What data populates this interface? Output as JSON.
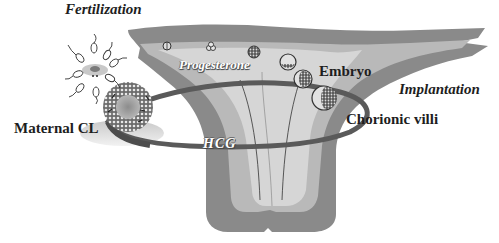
{
  "diagram": {
    "labels": {
      "fertilization": "Fertilization",
      "progesterone": "Progesterone",
      "embryo": "Embryo",
      "implantation": "Implantation",
      "chorionic_villi": "Chorionic villi",
      "maternal_cl": "Maternal CL",
      "hcg": "HCG"
    },
    "elements": [
      {
        "id": "oocyte-with-sperm",
        "description": "Oocyte surrounded by sperm at fertilization site"
      },
      {
        "id": "corpus-luteum",
        "description": "Maternal corpus luteum (follicle-like textured sphere)"
      },
      {
        "id": "uterine-tube",
        "description": "Fallopian tube with developing embryos"
      },
      {
        "id": "uterus",
        "description": "Uterine body with endometrium layers"
      },
      {
        "id": "embryo-stages",
        "count": 6,
        "description": "Zygote to blastocyst stages moving through the tube"
      },
      {
        "id": "hormone-loop",
        "description": "Elliptical loop connecting maternal CL and chorionic villi: progesterone (upper), HCG (lower)"
      }
    ],
    "colors": {
      "myometrium": "#8a8a8a",
      "endometrium": "#b9b9b9",
      "lumen": "#d6d6d6",
      "loop": "#5a5a5a",
      "text": "#1e1e1e"
    }
  }
}
